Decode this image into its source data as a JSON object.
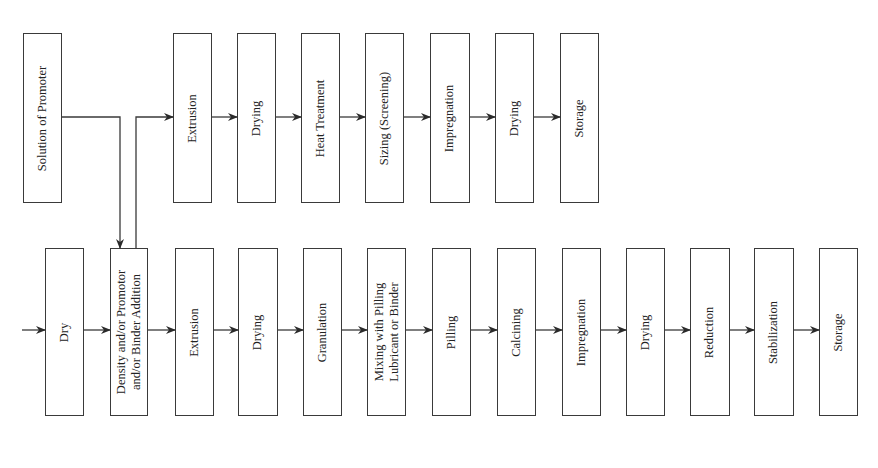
{
  "diagram": {
    "type": "process-flow",
    "orientation": "rotated-90",
    "top_row": [
      {
        "id": "t0",
        "label": "Solution of Promoter",
        "x": 23,
        "w": 39
      },
      {
        "id": "t1",
        "label": "Extrusion",
        "x": 173,
        "w": 39
      },
      {
        "id": "t2",
        "label": "Drying",
        "x": 237,
        "w": 39
      },
      {
        "id": "t3",
        "label": "Heat Treatment",
        "x": 301,
        "w": 39
      },
      {
        "id": "t4",
        "label": "Sizing (Screening)",
        "x": 365,
        "w": 39
      },
      {
        "id": "t5",
        "label": "Impregnation",
        "x": 430,
        "w": 40
      },
      {
        "id": "t6",
        "label": "Drying",
        "x": 495,
        "w": 39
      },
      {
        "id": "t7",
        "label": "Storage",
        "x": 560,
        "w": 39
      }
    ],
    "bottom_row": [
      {
        "id": "b0",
        "label": "Dry",
        "x": 45,
        "w": 39
      },
      {
        "id": "b1",
        "label": "Density and/or Promotor\nand/or Binder Addition",
        "x": 110,
        "w": 38
      },
      {
        "id": "b2",
        "label": "Extrusion",
        "x": 175,
        "w": 39
      },
      {
        "id": "b3",
        "label": "Drying",
        "x": 238,
        "w": 40
      },
      {
        "id": "b4",
        "label": "Granulation",
        "x": 303,
        "w": 39
      },
      {
        "id": "b5",
        "label": "Mixing with Pilling\nLubricant or Binder",
        "x": 367,
        "w": 39
      },
      {
        "id": "b6",
        "label": "Pilling",
        "x": 432,
        "w": 39
      },
      {
        "id": "b7",
        "label": "Calcining",
        "x": 497,
        "w": 39
      },
      {
        "id": "b8",
        "label": "Impregnation",
        "x": 562,
        "w": 39
      },
      {
        "id": "b9",
        "label": "Drying",
        "x": 626,
        "w": 39
      },
      {
        "id": "b10",
        "label": "Reduction",
        "x": 690,
        "w": 40
      },
      {
        "id": "b11",
        "label": "Stabilization",
        "x": 754,
        "w": 40
      },
      {
        "id": "b12",
        "label": "Storage",
        "x": 819,
        "w": 39
      }
    ],
    "layout": {
      "top_y": 33,
      "top_h": 170,
      "top_arrow_y": 117,
      "bottom_y": 248,
      "bottom_h": 168,
      "bottom_arrow_y": 330
    },
    "connections": [
      "input -> Dry",
      "Dry -> Density and/or Promotor and/or Binder Addition",
      "Solution of Promoter -> Density and/or Promotor and/or Binder Addition",
      "Density and/or Promotor and/or Binder Addition -> Extrusion (top row)",
      "Density and/or Promotor and/or Binder Addition -> Extrusion (bottom row)"
    ],
    "colors": {
      "line": "#3a3a3a",
      "background": "#ffffff",
      "text": "#222222"
    }
  }
}
